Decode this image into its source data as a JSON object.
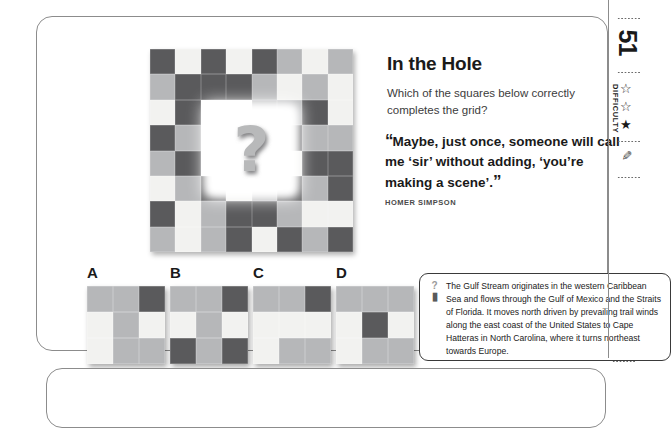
{
  "sidebar": {
    "puzzle_number": "51",
    "difficulty_label": "DIFFICULTY",
    "stars": [
      "star-outline",
      "star-outline",
      "star-filled"
    ],
    "pencil_icon": "pencil-icon"
  },
  "header": {
    "title": "In the Hole",
    "question": "Which of the squares below correctly completes the grid?"
  },
  "quote": {
    "open_mark": "“",
    "close_mark": "”",
    "text": "Maybe, just once, someone will call me ‘sir’ without adding, ‘you’re making a scene’.",
    "author": "HOMER SIMPSON"
  },
  "fact": {
    "icon": "question-mark-icon",
    "pin_icon": "pin-icon",
    "text": "The Gulf Stream originates in the western Caribbean Sea and flows through the Gulf of Mexico and the Straits of Florida. It moves north driven by prevailing trail winds along the east coast of the United States to Cape Hatteras in North Carolina, where it turns northeast towards Europe."
  },
  "puzzle": {
    "hole_symbol": "?",
    "colors": {
      "dark": "#5a5a5c",
      "mid": "#b6b7b9",
      "light": "#f2f2f0"
    },
    "grid": [
      [
        "dark",
        "light",
        "dark",
        "light",
        "dark",
        "mid",
        "light",
        "mid"
      ],
      [
        "mid",
        "dark",
        "dark",
        "dark",
        "mid",
        "light",
        "mid",
        "light"
      ],
      [
        "light",
        "dark",
        "hole",
        "hole",
        "mid",
        "mid",
        "dark",
        "light"
      ],
      [
        "dark",
        "mid",
        "hole",
        "hole",
        "dark",
        "dark",
        "mid",
        "mid"
      ],
      [
        "mid",
        "dark",
        "hole",
        "hole",
        "light",
        "light",
        "dark",
        "dark"
      ],
      [
        "light",
        "mid",
        "dark",
        "light",
        "mid",
        "dark",
        "mid",
        "dark"
      ],
      [
        "dark",
        "light",
        "mid",
        "dark",
        "dark",
        "mid",
        "light",
        "light"
      ],
      [
        "mid",
        "light",
        "mid",
        "dark",
        "light",
        "dark",
        "mid",
        "dark"
      ]
    ]
  },
  "options": [
    {
      "label": "A",
      "grid": [
        [
          "mid",
          "mid",
          "dark"
        ],
        [
          "light",
          "mid",
          "light"
        ],
        [
          "light",
          "mid",
          "mid"
        ]
      ]
    },
    {
      "label": "B",
      "grid": [
        [
          "mid",
          "mid",
          "dark"
        ],
        [
          "light",
          "mid",
          "light"
        ],
        [
          "dark",
          "mid",
          "dark"
        ]
      ]
    },
    {
      "label": "C",
      "grid": [
        [
          "mid",
          "mid",
          "dark"
        ],
        [
          "light",
          "light",
          "light"
        ],
        [
          "light",
          "mid",
          "mid"
        ]
      ]
    },
    {
      "label": "D",
      "grid": [
        [
          "mid",
          "mid",
          "mid"
        ],
        [
          "light",
          "dark",
          "light"
        ],
        [
          "light",
          "mid",
          "mid"
        ]
      ]
    }
  ]
}
